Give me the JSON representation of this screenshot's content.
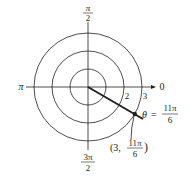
{
  "diagram": {
    "type": "polar-coordinate-plot",
    "angle_labels": {
      "top": {
        "num": "π",
        "den": "2"
      },
      "left": "π",
      "right": "0",
      "bottom": {
        "num": "3π",
        "den": "2"
      }
    },
    "radius_labels": [
      "2",
      "3"
    ],
    "point": {
      "r": 3,
      "theta_label_num": "11π",
      "theta_label_den": "6",
      "coord_prefix": "(3, ",
      "coord_suffix": ")"
    },
    "angle_eq": {
      "theta": "θ",
      "eq": "=",
      "num": "11π",
      "den": "6"
    },
    "colors": {
      "line": "#231f20",
      "background": "#ffffff"
    }
  }
}
